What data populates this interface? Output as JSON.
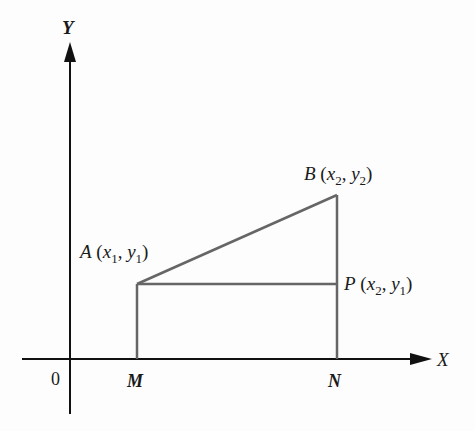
{
  "diagram": {
    "axes": {
      "x_label": "X",
      "y_label": "Y",
      "origin_label": "0"
    },
    "points": {
      "A": {
        "name": "A",
        "coord_x": "x",
        "coord_x_sub": "1",
        "coord_y": "y",
        "coord_y_sub": "1"
      },
      "B": {
        "name": "B",
        "coord_x": "x",
        "coord_x_sub": "2",
        "coord_y": "y",
        "coord_y_sub": "2"
      },
      "P": {
        "name": "P",
        "coord_x": "x",
        "coord_x_sub": "2",
        "coord_y": "y",
        "coord_y_sub": "1"
      }
    },
    "foot_labels": {
      "M": "M",
      "N": "N"
    },
    "colors": {
      "axis": "#111111",
      "figure_lines": "#666666"
    }
  }
}
